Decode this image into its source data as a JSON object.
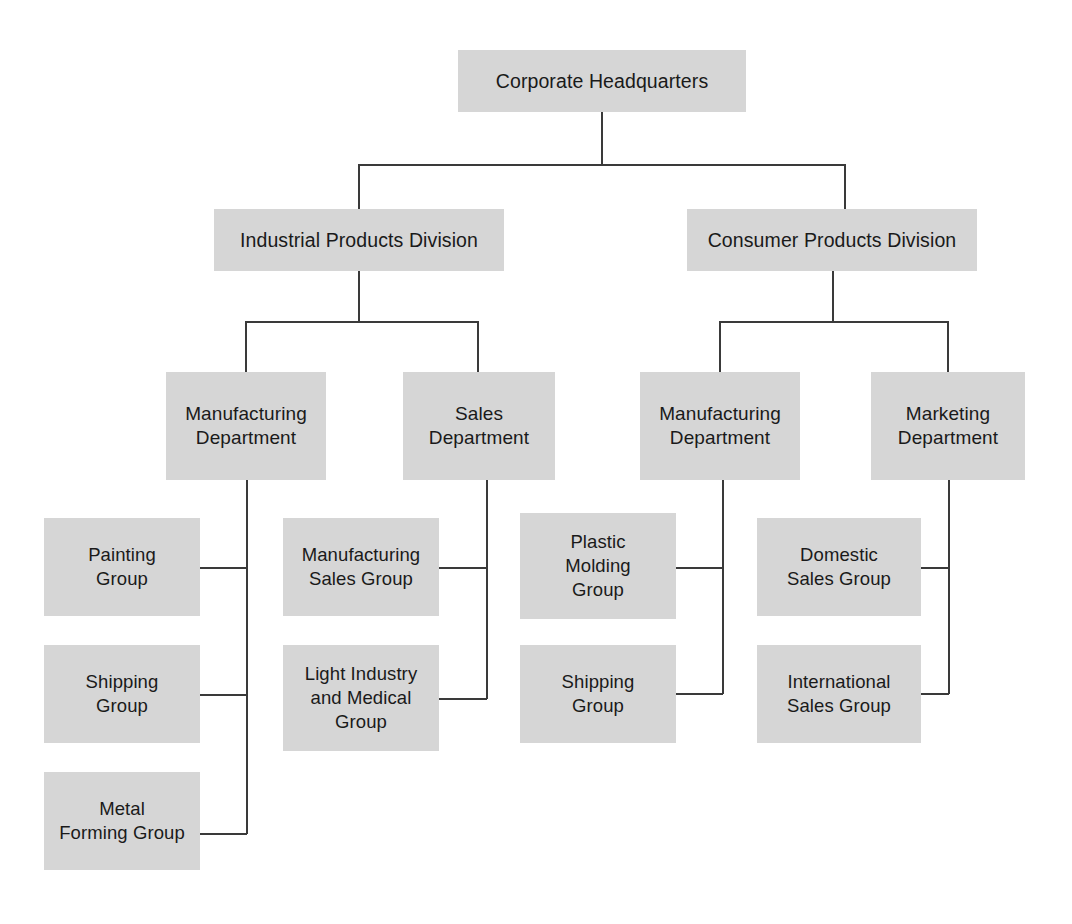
{
  "diagram": {
    "type": "org-chart",
    "background_color": "#ffffff",
    "box_fill_color": "#d6d6d6",
    "box_text_color": "#1a1a1a",
    "connector_color": "#3a3a3a"
  },
  "nodes": {
    "root": {
      "label": "Corporate Headquarters",
      "level": 0,
      "x": 458,
      "y": 50,
      "w": 288,
      "h": 62
    },
    "div_industrial": {
      "label": "Industrial Products Division",
      "level": 1,
      "x": 214,
      "y": 209,
      "w": 290,
      "h": 62
    },
    "div_consumer": {
      "label": "Consumer Products Division",
      "level": 1,
      "x": 687,
      "y": 209,
      "w": 290,
      "h": 62
    },
    "dept_ind_manufacturing": {
      "label": "Manufacturing\nDepartment",
      "level": 2,
      "x": 166,
      "y": 372,
      "w": 160,
      "h": 108
    },
    "dept_ind_sales": {
      "label": "Sales\nDepartment",
      "level": 2,
      "x": 403,
      "y": 372,
      "w": 152,
      "h": 108
    },
    "dept_con_manufacturing": {
      "label": "Manufacturing\nDepartment",
      "level": 2,
      "x": 640,
      "y": 372,
      "w": 160,
      "h": 108
    },
    "dept_con_marketing": {
      "label": "Marketing\nDepartment",
      "level": 2,
      "x": 871,
      "y": 372,
      "w": 154,
      "h": 108
    },
    "grp_painting": {
      "label": "Painting\nGroup",
      "level": 3,
      "x": 44,
      "y": 518,
      "w": 156,
      "h": 98
    },
    "grp_shipping_ind": {
      "label": "Shipping\nGroup",
      "level": 3,
      "x": 44,
      "y": 645,
      "w": 156,
      "h": 98
    },
    "grp_metal_forming": {
      "label": "Metal\nForming Group",
      "level": 3,
      "x": 44,
      "y": 772,
      "w": 156,
      "h": 98
    },
    "grp_mfg_sales": {
      "label": "Manufacturing\nSales Group",
      "level": 3,
      "x": 283,
      "y": 518,
      "w": 156,
      "h": 98
    },
    "grp_light_industry": {
      "label": "Light Industry\nand Medical\nGroup",
      "level": 3,
      "x": 283,
      "y": 645,
      "w": 156,
      "h": 106
    },
    "grp_plastic_molding": {
      "label": "Plastic\nMolding\nGroup",
      "level": 3,
      "x": 520,
      "y": 513,
      "w": 156,
      "h": 106
    },
    "grp_shipping_con": {
      "label": "Shipping\nGroup",
      "level": 3,
      "x": 520,
      "y": 645,
      "w": 156,
      "h": 98
    },
    "grp_domestic_sales": {
      "label": "Domestic\nSales Group",
      "level": 3,
      "x": 757,
      "y": 518,
      "w": 164,
      "h": 98
    },
    "grp_international_sales": {
      "label": "International\nSales Group",
      "level": 3,
      "x": 757,
      "y": 645,
      "w": 164,
      "h": 98
    }
  },
  "hierarchy": {
    "root": "Corporate Headquarters",
    "children": [
      {
        "name": "Industrial Products Division",
        "children": [
          {
            "name": "Manufacturing Department",
            "children": [
              "Painting Group",
              "Shipping Group",
              "Metal Forming Group"
            ]
          },
          {
            "name": "Sales Department",
            "children": [
              "Manufacturing Sales Group",
              "Light Industry and Medical Group"
            ]
          }
        ]
      },
      {
        "name": "Consumer Products Division",
        "children": [
          {
            "name": "Manufacturing Department",
            "children": [
              "Plastic Molding Group",
              "Shipping Group"
            ]
          },
          {
            "name": "Marketing Department",
            "children": [
              "Domestic Sales Group",
              "International Sales Group"
            ]
          }
        ]
      }
    ]
  }
}
